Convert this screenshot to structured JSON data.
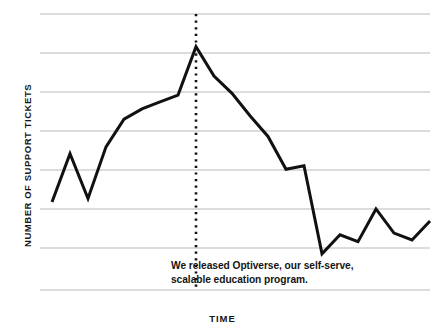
{
  "chart_data": {
    "type": "line",
    "title": "",
    "xlabel": "TIME",
    "ylabel": "NUMBER OF SUPPORT TICKETS",
    "grid": true,
    "gridlines": 8,
    "legend": "none",
    "axis_tick_labels": [],
    "xlim": [
      0,
      21
    ],
    "ylim": [
      0,
      8
    ],
    "series": [
      {
        "name": "Support tickets over time",
        "color": "#111111",
        "x": [
          0,
          1,
          2,
          3,
          4,
          5,
          6,
          7,
          8,
          9,
          10,
          11,
          12,
          13,
          14,
          15,
          16,
          17,
          18,
          19,
          20,
          21
        ],
        "values": [
          2.55,
          3.95,
          2.65,
          4.15,
          4.95,
          5.25,
          5.45,
          5.65,
          7.05,
          6.2,
          5.7,
          5.05,
          4.45,
          3.5,
          3.6,
          1.05,
          1.6,
          1.4,
          2.35,
          1.65,
          1.45,
          2.0
        ]
      }
    ],
    "annotation": {
      "marker_type": "vertical-dotted-line",
      "marker_x": 8,
      "marker_color": "#111111",
      "lines": [
        "We released Optiverse, our self-serve,",
        "scalable education program."
      ]
    },
    "style": {
      "background": "#ffffff",
      "gridline_color": "#b9b9b9",
      "line_color": "#111111",
      "line_width": 3
    }
  }
}
